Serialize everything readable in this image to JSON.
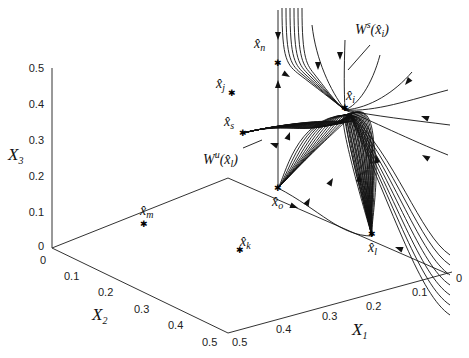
{
  "figure": {
    "type": "3d-phase-portrait",
    "axes": {
      "x1": {
        "label": "X",
        "sub": "1",
        "ticks": [
          "0",
          "0.1",
          "0.2",
          "0.3",
          "0.4",
          "0.5"
        ],
        "range": [
          0,
          0.5
        ]
      },
      "x2": {
        "label": "X",
        "sub": "2",
        "ticks": [
          "0",
          "0.1",
          "0.2",
          "0.3",
          "0.4",
          "0.5"
        ],
        "range": [
          0,
          0.5
        ]
      },
      "x3": {
        "label": "X",
        "sub": "3",
        "ticks": [
          "0",
          "0.1",
          "0.2",
          "0.3",
          "0.4",
          "0.5"
        ],
        "range": [
          0,
          0.5
        ]
      }
    },
    "equilibria": [
      {
        "name": "x-hat-n",
        "base": "x̂",
        "sub": "n"
      },
      {
        "name": "x-hat-j",
        "base": "x̂",
        "sub": "j"
      },
      {
        "name": "x-hat-s",
        "base": "x̂",
        "sub": "s"
      },
      {
        "name": "x-hat-i",
        "base": "x̂",
        "sub": "i"
      },
      {
        "name": "x-hat-m",
        "base": "x̂",
        "sub": "m"
      },
      {
        "name": "x-hat-o",
        "base": "x̂",
        "sub": "o"
      },
      {
        "name": "x-hat-k",
        "base": "x̂",
        "sub": "k"
      },
      {
        "name": "x-hat-l",
        "base": "x̂",
        "sub": "l"
      }
    ],
    "manifolds": {
      "stable": {
        "text": "W",
        "sup": "s",
        "arg": "(x̂",
        "argsub": "i",
        "close": ")"
      },
      "unstable": {
        "text": "W",
        "sup": "u",
        "arg": "(x̂",
        "argsub": "l",
        "close": ")"
      }
    }
  }
}
